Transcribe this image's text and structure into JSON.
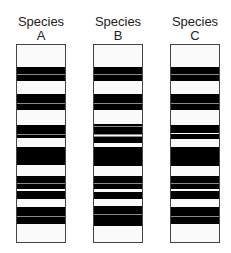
{
  "figure": {
    "columns": [
      {
        "title_line1": "Species",
        "title_line2": "A",
        "x": 16,
        "width": 50,
        "bands": [
          {
            "top": 22,
            "height": 14
          },
          {
            "top": 49,
            "height": 16
          },
          {
            "top": 80,
            "height": 13
          },
          {
            "top": 102,
            "height": 18
          },
          {
            "top": 131,
            "height": 13
          },
          {
            "top": 146,
            "height": 8
          },
          {
            "top": 162,
            "height": 17
          }
        ],
        "lines": [
          29,
          58,
          89,
          138,
          171
        ]
      },
      {
        "title_line1": "Species",
        "title_line2": "B",
        "x": 93,
        "width": 50,
        "bands": [
          {
            "top": 22,
            "height": 14
          },
          {
            "top": 49,
            "height": 16
          },
          {
            "top": 79,
            "height": 10
          },
          {
            "top": 91,
            "height": 7
          },
          {
            "top": 102,
            "height": 19
          },
          {
            "top": 131,
            "height": 13
          },
          {
            "top": 147,
            "height": 7
          },
          {
            "top": 161,
            "height": 20
          }
        ],
        "lines": [
          29,
          58,
          81,
          89,
          91,
          138,
          169
        ]
      },
      {
        "title_line1": "Species",
        "title_line2": "C",
        "x": 170,
        "width": 50,
        "bands": [
          {
            "top": 22,
            "height": 14
          },
          {
            "top": 49,
            "height": 16
          },
          {
            "top": 80,
            "height": 8
          },
          {
            "top": 89,
            "height": 5
          },
          {
            "top": 102,
            "height": 19
          },
          {
            "top": 131,
            "height": 13
          },
          {
            "top": 146,
            "height": 8
          },
          {
            "top": 162,
            "height": 17
          }
        ],
        "lines": [
          29,
          58,
          138,
          171
        ]
      }
    ]
  }
}
